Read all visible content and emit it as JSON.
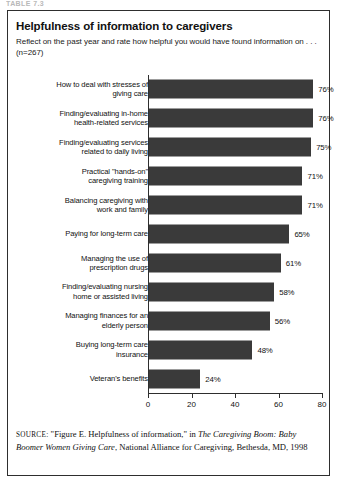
{
  "running_head": "TABLE 7.3",
  "figure": {
    "title": "Helpfulness of information to caregivers",
    "subtitle": "Reflect on the past year and rate how helpful you would have found information on . . . (n=267)",
    "source_prefix": "SOURCE:",
    "source_part1": " \"Figure E. Helpfulness of information,\" in ",
    "source_italic1": "The Caregiving Boom: Baby Boomer Women Giving Care",
    "source_part2": ", National Alliance for Caregiving, Bethesda, MD, 1998"
  },
  "chart_data": {
    "type": "bar",
    "orientation": "horizontal",
    "title": "Helpfulness of information to caregivers",
    "subtitle": "Reflect on the past year and rate how helpful you would have found information on . . . (n=267)",
    "xlabel": "",
    "ylabel": "",
    "xlim": [
      0,
      80
    ],
    "xticks": [
      0,
      20,
      40,
      60,
      80
    ],
    "xtick_labels": [
      "0",
      "20",
      "40",
      "60",
      "80"
    ],
    "grid": false,
    "legend": false,
    "bar_color": "#3a3a3a",
    "value_suffix": "%",
    "categories": [
      "How to deal with stresses of giving care",
      "Finding/evaluating in-home health-related services",
      "Finding/evaluating services related to daily living",
      "Practical \"hands-on\" caregiving training",
      "Balancing caregiving with work and family",
      "Paying for long-term care",
      "Managing the use of prescription drugs",
      "Finding/evaluating nursing home or assisted living",
      "Managing finances for an elderly person",
      "Buying long-term care insurance",
      "Veteran's benefits"
    ],
    "category_lines": [
      [
        "How to deal with stresses of",
        "giving care"
      ],
      [
        "Finding/evaluating in-home",
        "health-related services"
      ],
      [
        "Finding/evaluating services",
        "related to daily living"
      ],
      [
        "Practical \"hands-on\"",
        "caregiving training"
      ],
      [
        "Balancing caregiving with",
        "work and family"
      ],
      [
        "Paying for long-term care"
      ],
      [
        "Managing the use of",
        "prescription drugs"
      ],
      [
        "Finding/evaluating nursing",
        "home or assisted living"
      ],
      [
        "Managing finances for an",
        "elderly person"
      ],
      [
        "Buying long-term care",
        "insurance"
      ],
      [
        "Veteran's benefits"
      ]
    ],
    "values": [
      76,
      76,
      75,
      71,
      71,
      65,
      61,
      58,
      56,
      48,
      24
    ],
    "value_labels": [
      "76%",
      "76%",
      "75%",
      "71%",
      "71%",
      "65%",
      "61%",
      "58%",
      "56%",
      "48%",
      "24%"
    ]
  }
}
